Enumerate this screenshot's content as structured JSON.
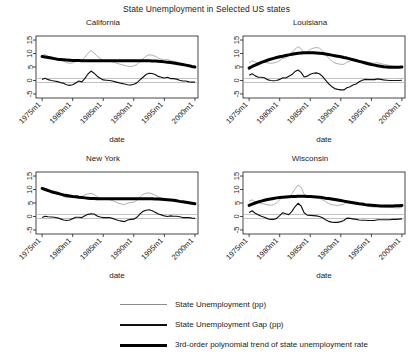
{
  "chart_data": {
    "type": "line",
    "title": "State Unemployment in Selected US states",
    "xlabel": "date",
    "ylabel": "",
    "xlim": [
      1974.0,
      2000.5
    ],
    "ylim": [
      -6.5,
      16.5
    ],
    "yticks": [
      -5,
      0,
      5,
      10,
      15
    ],
    "ytick_labels": [
      "-5",
      "0",
      "5",
      "10",
      "15"
    ],
    "xticks": [
      1975,
      1980,
      1985,
      1990,
      1995,
      2000
    ],
    "xtick_labels": [
      "1975m1",
      "1980m1",
      "1985m1",
      "1990m1",
      "1995m1",
      "2000m1"
    ],
    "grid": false,
    "legend_position": "bottom",
    "reference_lines": [
      0.75,
      -0.75
    ],
    "colors": {
      "unemployment": "#8c8c8c",
      "gap": "#111111",
      "trend": "#000000",
      "reference": "#b0b0b0",
      "axis": "#1a1a1a"
    },
    "series_names": [
      "State Unemployment (pp)",
      "State Unemployment Gap (pp)",
      "3rd-order polynomial trend of state unemployment rate"
    ],
    "panels": [
      {
        "name": "California",
        "x": [
          1975.0,
          1975.5,
          1976.0,
          1976.5,
          1977.0,
          1977.5,
          1978.0,
          1978.5,
          1979.0,
          1979.5,
          1980.0,
          1980.5,
          1981.0,
          1981.5,
          1982.0,
          1982.5,
          1983.0,
          1983.5,
          1984.0,
          1984.5,
          1985.0,
          1985.5,
          1986.0,
          1986.5,
          1987.0,
          1987.5,
          1988.0,
          1988.5,
          1989.0,
          1989.5,
          1990.0,
          1990.5,
          1991.0,
          1991.5,
          1992.0,
          1992.5,
          1993.0,
          1993.5,
          1994.0,
          1994.5,
          1995.0,
          1995.5,
          1996.0,
          1996.5,
          1997.0,
          1997.5,
          1998.0,
          1998.5,
          1999.0,
          1999.5,
          2000.0
        ],
        "unemployment": [
          9.3,
          9.6,
          9.0,
          8.6,
          8.3,
          8.0,
          7.5,
          7.2,
          6.6,
          6.4,
          6.5,
          7.2,
          7.8,
          7.4,
          8.6,
          10.1,
          11.1,
          10.2,
          9.0,
          8.1,
          7.5,
          7.3,
          7.2,
          6.9,
          6.6,
          6.2,
          5.9,
          5.6,
          5.3,
          5.2,
          5.4,
          5.9,
          7.0,
          8.0,
          9.0,
          9.5,
          9.4,
          9.0,
          8.3,
          7.9,
          7.6,
          7.8,
          7.3,
          7.2,
          6.9,
          6.4,
          6.0,
          5.9,
          5.4,
          5.1,
          4.9
        ],
        "gap": [
          0.4,
          0.8,
          0.3,
          0.0,
          -0.2,
          -0.4,
          -0.8,
          -1.0,
          -1.6,
          -1.8,
          -1.6,
          -0.9,
          -0.2,
          -0.5,
          0.8,
          2.4,
          3.5,
          2.7,
          1.6,
          0.8,
          0.2,
          0.1,
          0.0,
          -0.2,
          -0.5,
          -0.8,
          -1.1,
          -1.3,
          -1.6,
          -1.7,
          -1.4,
          -0.9,
          0.2,
          1.2,
          2.2,
          2.7,
          2.6,
          2.2,
          1.5,
          1.2,
          0.9,
          1.2,
          0.7,
          0.7,
          0.5,
          0.1,
          -0.2,
          -0.2,
          -0.5,
          -0.6,
          -0.6
        ],
        "trend": [
          8.9,
          8.7,
          8.5,
          8.3,
          8.1,
          7.9,
          7.8,
          7.7,
          7.6,
          7.5,
          7.4,
          7.4,
          7.4,
          7.3,
          7.3,
          7.3,
          7.3,
          7.3,
          7.3,
          7.3,
          7.3,
          7.3,
          7.3,
          7.3,
          7.3,
          7.3,
          7.3,
          7.3,
          7.3,
          7.3,
          7.3,
          7.3,
          7.3,
          7.3,
          7.3,
          7.3,
          7.2,
          7.2,
          7.1,
          7.0,
          6.9,
          6.8,
          6.7,
          6.5,
          6.3,
          6.1,
          5.9,
          5.7,
          5.5,
          5.2,
          5.0
        ]
      },
      {
        "name": "Louisiana",
        "x": [
          1975.0,
          1975.5,
          1976.0,
          1976.5,
          1977.0,
          1977.5,
          1978.0,
          1978.5,
          1979.0,
          1979.5,
          1980.0,
          1980.5,
          1981.0,
          1981.5,
          1982.0,
          1982.5,
          1983.0,
          1983.5,
          1984.0,
          1984.5,
          1985.0,
          1985.5,
          1986.0,
          1986.5,
          1987.0,
          1987.5,
          1988.0,
          1988.5,
          1989.0,
          1989.5,
          1990.0,
          1990.5,
          1991.0,
          1991.5,
          1992.0,
          1992.5,
          1993.0,
          1993.5,
          1994.0,
          1994.5,
          1995.0,
          1995.5,
          1996.0,
          1996.5,
          1997.0,
          1997.5,
          1998.0,
          1998.5,
          1999.0,
          1999.5,
          2000.0
        ],
        "unemployment": [
          6.5,
          7.3,
          6.8,
          6.6,
          6.9,
          7.0,
          6.5,
          6.4,
          6.5,
          6.8,
          7.4,
          8.2,
          8.4,
          9.3,
          10.2,
          11.6,
          12.5,
          11.8,
          10.2,
          10.6,
          11.5,
          12.0,
          12.2,
          12.0,
          11.0,
          9.6,
          8.3,
          7.3,
          6.5,
          6.2,
          6.0,
          6.0,
          6.8,
          7.2,
          7.8,
          7.6,
          7.4,
          7.2,
          7.0,
          6.7,
          6.5,
          6.4,
          6.6,
          6.3,
          6.0,
          5.8,
          5.5,
          5.4,
          5.2,
          5.0,
          4.9
        ],
        "gap": [
          1.9,
          2.5,
          1.7,
          1.2,
          1.2,
          1.0,
          0.3,
          0.0,
          -0.1,
          0.0,
          0.4,
          1.0,
          0.9,
          1.6,
          2.2,
          3.3,
          3.9,
          3.0,
          1.3,
          1.6,
          2.3,
          2.7,
          2.8,
          2.5,
          1.5,
          0.1,
          -1.2,
          -2.2,
          -3.0,
          -3.3,
          -3.5,
          -3.5,
          -2.7,
          -2.3,
          -1.7,
          -1.3,
          -0.5,
          0.1,
          0.4,
          0.3,
          0.3,
          0.3,
          0.6,
          0.4,
          0.2,
          0.1,
          0.0,
          0.0,
          0.0,
          0.0,
          0.1
        ],
        "trend": [
          4.6,
          5.2,
          5.7,
          6.2,
          6.7,
          7.1,
          7.5,
          7.9,
          8.2,
          8.5,
          8.8,
          9.0,
          9.3,
          9.5,
          9.7,
          9.9,
          10.1,
          10.2,
          10.3,
          10.3,
          10.3,
          10.3,
          10.2,
          10.1,
          10.0,
          9.8,
          9.6,
          9.4,
          9.2,
          9.0,
          8.8,
          8.5,
          8.3,
          8.0,
          7.7,
          7.4,
          7.1,
          6.8,
          6.5,
          6.2,
          5.9,
          5.7,
          5.5,
          5.3,
          5.1,
          5.0,
          4.9,
          4.9,
          4.9,
          4.9,
          5.0
        ]
      },
      {
        "name": "New York",
        "x": [
          1975.0,
          1975.5,
          1976.0,
          1976.5,
          1977.0,
          1977.5,
          1978.0,
          1978.5,
          1979.0,
          1979.5,
          1980.0,
          1980.5,
          1981.0,
          1981.5,
          1982.0,
          1982.5,
          1983.0,
          1983.5,
          1984.0,
          1984.5,
          1985.0,
          1985.5,
          1986.0,
          1986.5,
          1987.0,
          1987.5,
          1988.0,
          1988.5,
          1989.0,
          1989.5,
          1990.0,
          1990.5,
          1991.0,
          1991.5,
          1992.0,
          1992.5,
          1993.0,
          1993.5,
          1994.0,
          1994.5,
          1995.0,
          1995.5,
          1996.0,
          1996.5,
          1997.0,
          1997.5,
          1998.0,
          1998.5,
          1999.0,
          1999.5,
          2000.0
        ],
        "unemployment": [
          10.0,
          10.4,
          10.0,
          9.6,
          9.2,
          8.7,
          8.0,
          7.4,
          7.0,
          7.0,
          7.3,
          7.7,
          7.6,
          7.4,
          8.0,
          8.4,
          8.5,
          8.2,
          7.3,
          6.8,
          6.5,
          6.4,
          6.3,
          5.9,
          5.4,
          4.9,
          4.6,
          4.4,
          5.0,
          5.2,
          5.3,
          6.0,
          7.2,
          8.2,
          8.6,
          8.8,
          8.4,
          7.9,
          7.2,
          6.9,
          6.4,
          6.2,
          6.3,
          6.1,
          6.0,
          5.7,
          5.3,
          5.2,
          5.1,
          4.8,
          4.6
        ],
        "gap": [
          -0.4,
          0.1,
          -0.1,
          -0.2,
          -0.3,
          -0.5,
          -0.9,
          -1.3,
          -1.5,
          -1.3,
          -0.8,
          -0.3,
          -0.3,
          -0.4,
          0.3,
          0.8,
          1.0,
          0.9,
          0.2,
          -0.2,
          -0.4,
          -0.4,
          -0.4,
          -0.7,
          -1.1,
          -1.5,
          -1.7,
          -1.9,
          -1.3,
          -1.1,
          -1.0,
          -0.3,
          0.9,
          1.9,
          2.3,
          2.5,
          2.1,
          1.6,
          0.9,
          0.6,
          0.2,
          0.0,
          0.2,
          0.1,
          0.1,
          -0.1,
          -0.4,
          -0.4,
          -0.4,
          -0.6,
          -0.7
        ],
        "trend": [
          10.4,
          10.0,
          9.6,
          9.2,
          8.9,
          8.6,
          8.3,
          8.0,
          7.8,
          7.6,
          7.4,
          7.3,
          7.1,
          7.0,
          6.9,
          6.8,
          6.7,
          6.7,
          6.6,
          6.6,
          6.6,
          6.6,
          6.6,
          6.6,
          6.6,
          6.6,
          6.6,
          6.6,
          6.6,
          6.6,
          6.6,
          6.6,
          6.6,
          6.6,
          6.6,
          6.6,
          6.6,
          6.5,
          6.5,
          6.4,
          6.3,
          6.2,
          6.1,
          6.0,
          5.8,
          5.6,
          5.5,
          5.3,
          5.1,
          4.9,
          4.7
        ]
      },
      {
        "name": "Wisconsin",
        "x": [
          1975.0,
          1975.5,
          1976.0,
          1976.5,
          1977.0,
          1977.5,
          1978.0,
          1978.5,
          1979.0,
          1979.5,
          1980.0,
          1980.5,
          1981.0,
          1981.5,
          1982.0,
          1982.5,
          1983.0,
          1983.5,
          1984.0,
          1984.5,
          1985.0,
          1985.5,
          1986.0,
          1986.5,
          1987.0,
          1987.5,
          1988.0,
          1988.5,
          1989.0,
          1989.5,
          1990.0,
          1990.5,
          1991.0,
          1991.5,
          1992.0,
          1992.5,
          1993.0,
          1993.5,
          1994.0,
          1994.5,
          1995.0,
          1995.5,
          1996.0,
          1996.5,
          1997.0,
          1997.5,
          1998.0,
          1998.5,
          1999.0,
          1999.5,
          2000.0
        ],
        "unemployment": [
          5.6,
          6.2,
          5.4,
          5.0,
          4.8,
          4.6,
          4.3,
          4.2,
          4.4,
          5.0,
          6.2,
          7.4,
          7.2,
          7.0,
          8.4,
          10.2,
          11.7,
          10.8,
          8.3,
          7.4,
          7.3,
          7.2,
          7.1,
          6.8,
          6.2,
          5.5,
          4.8,
          4.4,
          4.2,
          4.1,
          4.3,
          4.6,
          5.5,
          5.3,
          5.0,
          4.7,
          4.4,
          4.2,
          4.0,
          3.8,
          3.6,
          3.5,
          3.7,
          3.6,
          3.5,
          3.4,
          3.3,
          3.3,
          3.2,
          3.2,
          3.3
        ],
        "gap": [
          1.5,
          2.1,
          1.2,
          0.6,
          0.1,
          -0.3,
          -0.8,
          -1.1,
          -1.1,
          -0.7,
          0.3,
          1.4,
          1.0,
          0.7,
          1.9,
          3.6,
          4.9,
          3.9,
          1.4,
          0.5,
          0.4,
          0.3,
          0.2,
          0.0,
          -0.5,
          -1.2,
          -1.8,
          -2.1,
          -2.2,
          -2.2,
          -1.9,
          -1.5,
          -0.6,
          -0.7,
          -0.9,
          -1.1,
          -1.3,
          -1.4,
          -1.4,
          -1.5,
          -1.5,
          -1.5,
          -1.2,
          -1.2,
          -1.2,
          -1.2,
          -1.2,
          -1.1,
          -1.1,
          -1.0,
          -0.9
        ],
        "trend": [
          4.1,
          4.6,
          5.0,
          5.4,
          5.7,
          6.0,
          6.3,
          6.5,
          6.7,
          6.9,
          7.0,
          7.1,
          7.2,
          7.3,
          7.4,
          7.4,
          7.5,
          7.5,
          7.5,
          7.4,
          7.4,
          7.3,
          7.2,
          7.1,
          7.0,
          6.8,
          6.7,
          6.5,
          6.3,
          6.1,
          5.9,
          5.7,
          5.5,
          5.3,
          5.1,
          4.9,
          4.7,
          4.6,
          4.4,
          4.3,
          4.2,
          4.1,
          4.0,
          3.9,
          3.9,
          3.9,
          3.9,
          3.9,
          4.0,
          4.0,
          4.1
        ]
      }
    ]
  }
}
